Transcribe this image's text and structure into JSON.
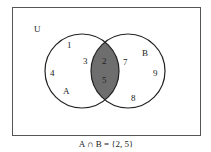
{
  "universe_label": "U",
  "set_a": {
    "label": "A",
    "only_elements": [
      "1",
      "3",
      "4"
    ]
  },
  "set_b": {
    "label": "B",
    "only_elements": [
      "7",
      "9",
      "8"
    ]
  },
  "intersection": {
    "elements": [
      "2",
      "5"
    ],
    "fill_color": "#6e6e6e"
  },
  "caption": "A ∩ B = {2, 5}"
}
